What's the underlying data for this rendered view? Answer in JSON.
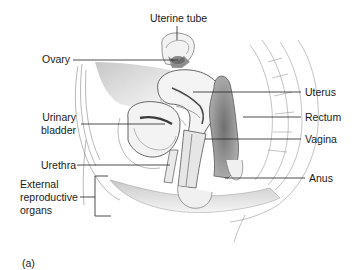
{
  "figure": {
    "panel_label": "(a)",
    "labels_left": [
      {
        "id": "ovary",
        "text": "Ovary"
      },
      {
        "id": "urinary-bladder",
        "line1": "Urinary",
        "line2": "bladder"
      },
      {
        "id": "urethra",
        "text": "Urethra"
      },
      {
        "id": "external-reproductive-organs",
        "line1": "External",
        "line2": "reproductive",
        "line3": "organs"
      }
    ],
    "labels_top": [
      {
        "id": "uterine-tube",
        "text": "Uterine tube"
      }
    ],
    "labels_right": [
      {
        "id": "uterus",
        "text": "Uterus"
      },
      {
        "id": "rectum",
        "text": "Rectum"
      },
      {
        "id": "vagina",
        "text": "Vagina"
      },
      {
        "id": "anus",
        "text": "Anus"
      }
    ]
  },
  "colors": {
    "leader_line": "#222222",
    "outline": "#6a6a6a",
    "shade_dark": "#8a8a8a",
    "shade_mid": "#bdbdbd",
    "shade_light": "#e4e4e4",
    "text": "#1a1a1a",
    "background": "#ffffff"
  }
}
